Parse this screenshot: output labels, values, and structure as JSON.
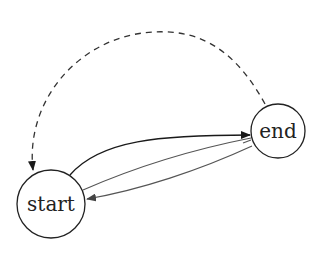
{
  "diagram": {
    "type": "state-machine",
    "nodes": [
      {
        "id": "start",
        "label": "start",
        "cx": 51,
        "cy": 204,
        "r": 34
      },
      {
        "id": "end",
        "label": "end",
        "cx": 278,
        "cy": 131,
        "r": 27
      }
    ],
    "edges": [
      {
        "from": "start",
        "to": "end",
        "style": "solid",
        "label": ""
      },
      {
        "from": "start",
        "to": "end",
        "style": "solid",
        "label": ""
      },
      {
        "from": "end",
        "to": "start",
        "style": "solid",
        "label": ""
      },
      {
        "from": "end",
        "to": "start",
        "style": "dashed",
        "label": ""
      }
    ],
    "colors": {
      "stroke": "#222222",
      "edge_gray": "#555555",
      "background": "#ffffff"
    }
  }
}
